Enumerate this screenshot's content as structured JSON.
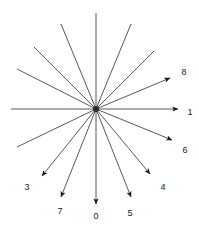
{
  "figure": {
    "title": "",
    "type": "radial-ray-diagram",
    "background_color": "#ffffff",
    "line_color": "#5a5a5a",
    "arrow_color": "#1a1a1a",
    "label_color": "#1a1a1a",
    "center": {
      "x": 96,
      "y": 109
    },
    "hub_marker": {
      "shape": "dot",
      "radius": 3,
      "color": "#2b2b2b"
    },
    "ray_count": 16,
    "angle_step_degrees": 22.5
  },
  "chart_data": {
    "type": "scatter",
    "title": "",
    "xlabel": "",
    "ylabel": "",
    "center": [
      96,
      109
    ],
    "rays": [
      {
        "id": "ray-1",
        "label": "1",
        "angle_deg": 0,
        "length": 82,
        "arrow": true,
        "tip": [
          178,
          109
        ],
        "label_pos": [
          190,
          112
        ]
      },
      {
        "id": "ray-8",
        "label": "8",
        "angle_deg": 22.5,
        "length": 80,
        "arrow": true,
        "tip": [
          170,
          78
        ],
        "label_pos": [
          184,
          72
        ]
      },
      {
        "id": "ray-a",
        "label": "",
        "angle_deg": 45,
        "length": 82,
        "arrow": false,
        "tip": [
          154,
          51
        ],
        "label_pos": null
      },
      {
        "id": "ray-b",
        "label": "",
        "angle_deg": 67.5,
        "length": 92,
        "arrow": false,
        "tip": [
          131,
          24
        ],
        "label_pos": null
      },
      {
        "id": "ray-c",
        "label": "",
        "angle_deg": 90,
        "length": 96,
        "arrow": false,
        "tip": [
          96,
          13
        ],
        "label_pos": null
      },
      {
        "id": "ray-d",
        "label": "",
        "angle_deg": 112.5,
        "length": 92,
        "arrow": false,
        "tip": [
          61,
          24
        ],
        "label_pos": null
      },
      {
        "id": "ray-e",
        "label": "",
        "angle_deg": 135,
        "length": 88,
        "arrow": false,
        "tip": [
          34,
          47
        ],
        "label_pos": null
      },
      {
        "id": "ray-f",
        "label": "",
        "angle_deg": 157.5,
        "length": 85,
        "arrow": false,
        "tip": [
          17,
          69
        ],
        "label_pos": null
      },
      {
        "id": "ray-g",
        "label": "",
        "angle_deg": 180,
        "length": 85,
        "arrow": false,
        "tip": [
          11,
          109
        ],
        "label_pos": null
      },
      {
        "id": "ray-h",
        "label": "",
        "angle_deg": 202.5,
        "length": 85,
        "arrow": false,
        "tip": [
          17,
          147
        ],
        "label_pos": null
      },
      {
        "id": "ray-3",
        "label": "3",
        "angle_deg": 225,
        "length": 74,
        "arrow": true,
        "tip": [
          42,
          176
        ],
        "label_pos": [
          27,
          187
        ]
      },
      {
        "id": "ray-7",
        "label": "7",
        "angle_deg": 247.5,
        "length": 95,
        "arrow": true,
        "tip": [
          61,
          197
        ],
        "label_pos": [
          60,
          211
        ]
      },
      {
        "id": "ray-0",
        "label": "0",
        "angle_deg": 270,
        "length": 95,
        "arrow": true,
        "tip": [
          96,
          204
        ],
        "label_pos": [
          96,
          216
        ]
      },
      {
        "id": "ray-5",
        "label": "5",
        "angle_deg": 292.5,
        "length": 95,
        "arrow": true,
        "tip": [
          131,
          197
        ],
        "label_pos": [
          130,
          213
        ]
      },
      {
        "id": "ray-4",
        "label": "4",
        "angle_deg": 315,
        "length": 74,
        "arrow": true,
        "tip": [
          150,
          174
        ],
        "label_pos": [
          163,
          187
        ]
      },
      {
        "id": "ray-6",
        "label": "6",
        "angle_deg": 337.5,
        "length": 82,
        "arrow": true,
        "tip": [
          172,
          140
        ],
        "label_pos": [
          185,
          150
        ]
      }
    ]
  }
}
